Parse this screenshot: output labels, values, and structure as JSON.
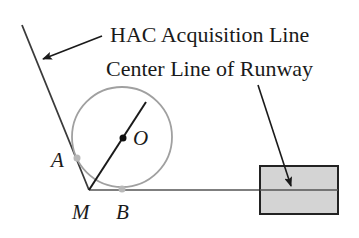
{
  "labels": {
    "hac": "HAC Acquisition Line",
    "centerline": "Center Line of Runway",
    "point_O": "O",
    "point_A": "A",
    "point_M": "M",
    "point_B": "B"
  },
  "colors": {
    "line": "#3a3a3a",
    "circle": "#9a9a9a",
    "runway_fill": "#d4d4d4",
    "point_gray": "#b0b0b0",
    "point_black": "#111111"
  }
}
